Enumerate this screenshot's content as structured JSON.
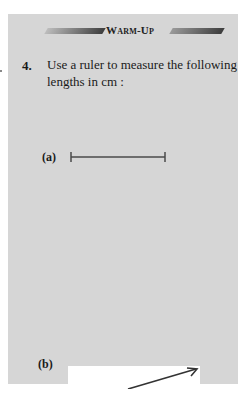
{
  "section": {
    "banner_title": "Warm-Up"
  },
  "question": {
    "number": "4.",
    "text": "Use a ruler to measure the following lengths in cm :"
  },
  "parts": [
    {
      "label": "(a)",
      "figure": "line-segment"
    },
    {
      "label": "(b)",
      "figure": "arrow-segment"
    }
  ],
  "colors": {
    "panel_bg": "#d6d6d6",
    "ink": "#3d3d3d"
  }
}
